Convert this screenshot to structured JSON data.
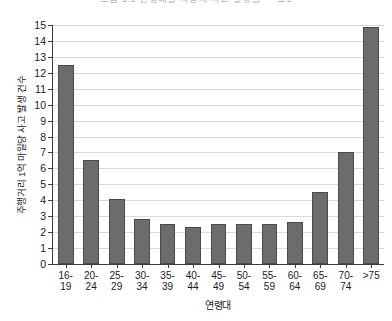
{
  "chart_data": {
    "type": "bar",
    "title": "그림 1.1 연령대별 자동차 사고 발생률 — 표1",
    "xlabel": "연령대",
    "ylabel": "주행거리 1억 마일당 사고 발생 건수",
    "categories": [
      "16-\n19",
      "20-\n24",
      "25-\n29",
      "30-\n34",
      "35-\n39",
      "40-\n44",
      "45-\n49",
      "50-\n54",
      "55-\n59",
      "60-\n64",
      "65-\n69",
      "70-\n74",
      ">75"
    ],
    "category_labels": [
      [
        "16-",
        "19"
      ],
      [
        "20-",
        "24"
      ],
      [
        "25-",
        "29"
      ],
      [
        "30-",
        "34"
      ],
      [
        "35-",
        "39"
      ],
      [
        "40-",
        "44"
      ],
      [
        "45-",
        "49"
      ],
      [
        "50-",
        "54"
      ],
      [
        "55-",
        "59"
      ],
      [
        "60-",
        "64"
      ],
      [
        "65-",
        "69"
      ],
      [
        "70-",
        "74"
      ],
      [
        ">75",
        ""
      ]
    ],
    "values": [
      12.5,
      6.5,
      4.05,
      2.8,
      2.5,
      2.3,
      2.5,
      2.5,
      2.5,
      2.65,
      4.5,
      7.05,
      14.9
    ],
    "ylim": [
      0,
      15
    ],
    "ytick_values": [
      0,
      1,
      2,
      3,
      4,
      5,
      6,
      7,
      8,
      9,
      10,
      11,
      12,
      13,
      14,
      15
    ],
    "ytick_labels": [
      "0",
      "1",
      "2",
      "3",
      "4",
      "5",
      "6",
      "7",
      "8",
      "9",
      "10",
      "11",
      "12",
      "13",
      "14",
      "15"
    ],
    "grid": true,
    "grid_axis": "y",
    "legend": false,
    "bar_color": "#6c6c6c",
    "bar_edge_color": "#4a4a4a",
    "grid_color": "#d9d9d9",
    "axis_color": "#3b3b3b",
    "background_color": "#ffffff"
  }
}
